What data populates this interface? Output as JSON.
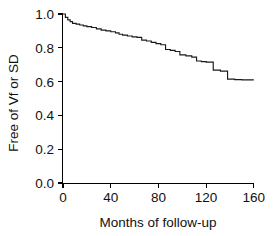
{
  "chart_data": {
    "type": "line",
    "subtype": "kaplan-meier-step",
    "title": "",
    "xlabel": "Months of follow-up",
    "ylabel": "Free of Vf or SD",
    "xlim": [
      0,
      160
    ],
    "ylim": [
      0.0,
      1.0
    ],
    "xticks": [
      0,
      40,
      80,
      120,
      160
    ],
    "xtick_labels": [
      "0",
      "40",
      "80",
      "120",
      "160"
    ],
    "yticks": [
      0.0,
      0.2,
      0.4,
      0.6,
      0.8,
      1.0
    ],
    "ytick_labels": [
      "0.0",
      "0.2",
      "0.4",
      "0.6",
      "0.8",
      "1.0"
    ],
    "grid": false,
    "legend": false,
    "line_color": "#1a1a1a",
    "series": [
      {
        "name": "Freedom from Vf or SD",
        "x": [
          0,
          2,
          4,
          6,
          8,
          11,
          14,
          17,
          20,
          24,
          28,
          32,
          36,
          40,
          44,
          47,
          50,
          54,
          58,
          62,
          66,
          70,
          74,
          78,
          82,
          86,
          90,
          94,
          98,
          103,
          108,
          112,
          116,
          120,
          126,
          132,
          138,
          144,
          150,
          160
        ],
        "y": [
          1.0,
          0.98,
          0.965,
          0.955,
          0.945,
          0.94,
          0.935,
          0.93,
          0.925,
          0.92,
          0.912,
          0.905,
          0.9,
          0.895,
          0.888,
          0.88,
          0.875,
          0.87,
          0.865,
          0.862,
          0.845,
          0.84,
          0.832,
          0.825,
          0.818,
          0.79,
          0.785,
          0.778,
          0.758,
          0.752,
          0.745,
          0.722,
          0.718,
          0.715,
          0.668,
          0.662,
          0.615,
          0.612,
          0.61,
          0.61
        ]
      }
    ]
  },
  "axes": {
    "x_title": "Months of follow-up",
    "y_title": "Free of Vf or SD"
  }
}
